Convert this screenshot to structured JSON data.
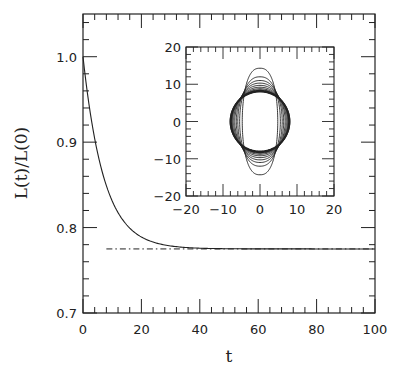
{
  "chart_data": [
    {
      "type": "line",
      "role": "main",
      "title": "",
      "xlabel": "t",
      "ylabel": "L(t)/L(0)",
      "xlim": [
        0,
        100
      ],
      "ylim": [
        0.7,
        1.05
      ],
      "xticks": [
        0,
        20,
        40,
        60,
        80,
        100
      ],
      "xtick_labels": [
        "0",
        "20",
        "40",
        "60",
        "80",
        "100"
      ],
      "yticks": [
        0.7,
        0.8,
        0.9,
        1.0
      ],
      "ytick_labels": [
        "0.7",
        "0.8",
        "0.9",
        "1.0"
      ],
      "grid": false,
      "legend": null,
      "series": [
        {
          "name": "L(t)/L(0)",
          "style": "solid",
          "x": [
            0,
            2,
            4,
            6,
            8,
            10,
            12,
            15,
            18,
            20,
            25,
            30,
            35,
            40,
            50,
            60,
            80,
            100
          ],
          "y": [
            1.0,
            0.948,
            0.906,
            0.872,
            0.846,
            0.826,
            0.81,
            0.794,
            0.785,
            0.782,
            0.778,
            0.776,
            0.7755,
            0.775,
            0.775,
            0.775,
            0.775,
            0.775
          ]
        },
        {
          "name": "asymptote",
          "style": "dash-dot",
          "x": [
            8,
            100
          ],
          "y": [
            0.775,
            0.775
          ]
        }
      ]
    },
    {
      "type": "line",
      "role": "inset",
      "title": "",
      "xlabel": "",
      "ylabel": "",
      "xlim": [
        -20,
        20
      ],
      "ylim": [
        -20,
        20
      ],
      "xticks": [
        -20,
        -10,
        0,
        10,
        20
      ],
      "xtick_labels": [
        "-20",
        "-10",
        "0",
        "10",
        "20"
      ],
      "yticks": [
        -20,
        -10,
        0,
        10,
        20
      ],
      "ytick_labels": [
        "-20",
        "-10",
        "0",
        "10",
        "20"
      ],
      "description": "Family of nested closed contours relaxing from a vertically elongated shape (semi-axes ~5 x 14) toward a circle of radius ~8",
      "series": [
        {
          "name": "contour-1",
          "a": 4.8,
          "b": 14.3
        },
        {
          "name": "contour-2",
          "a": 5.5,
          "b": 12.0
        },
        {
          "name": "contour-3",
          "a": 6.0,
          "b": 11.0
        },
        {
          "name": "contour-4",
          "a": 6.4,
          "b": 10.3
        },
        {
          "name": "contour-5",
          "a": 6.8,
          "b": 9.7
        },
        {
          "name": "contour-6",
          "a": 7.1,
          "b": 9.2
        },
        {
          "name": "contour-7",
          "a": 7.4,
          "b": 8.8
        },
        {
          "name": "contour-8",
          "a": 7.6,
          "b": 8.5
        },
        {
          "name": "contour-9",
          "a": 7.8,
          "b": 8.3
        },
        {
          "name": "contour-10",
          "a": 8.0,
          "b": 8.1
        },
        {
          "name": "contour-11",
          "a": 8.0,
          "b": 8.0
        }
      ]
    }
  ]
}
